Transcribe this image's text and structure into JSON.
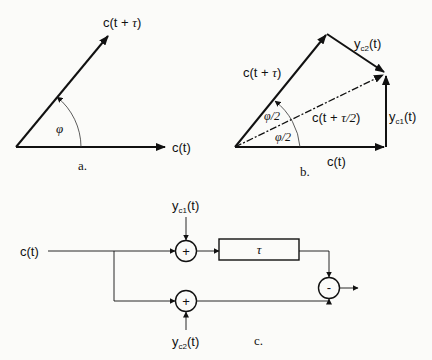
{
  "diagram_a": {
    "caption": "a.",
    "vector_ref_label": "c(t)",
    "vector_delayed_label_prefix": "c(t  + ",
    "vector_delayed_label_tau": "τ",
    "vector_delayed_label_suffix": ")",
    "angle_label": "φ"
  },
  "diagram_b": {
    "caption": "b.",
    "vector_ref_label": "c(t)",
    "vector_delayed_label_prefix": "c(t  + ",
    "vector_delayed_label_tau": "τ",
    "vector_delayed_label_suffix": ")",
    "vector_half_label_prefix": "c(t  + ",
    "vector_half_label_tau": "τ/2",
    "vector_half_label_suffix": ")",
    "yc1_label_main": "y",
    "yc1_label_sub": "c1",
    "yc1_label_arg": "(t)",
    "yc2_label_main": "y",
    "yc2_label_sub": "c2",
    "yc2_label_arg": "(t)",
    "half_angle_upper": "φ/2",
    "half_angle_lower": "φ/2"
  },
  "diagram_c": {
    "caption": "c.",
    "input_label": "c(t)",
    "sum1_symbol": "+",
    "sum2_symbol": "+",
    "diff_symbol": "-",
    "delay_block_label": "τ",
    "yc1_label_main": "y",
    "yc1_label_sub": "c1",
    "yc1_label_arg": "(t)",
    "yc2_label_main": "y",
    "yc2_label_sub": "c2",
    "yc2_label_arg": "(t)"
  }
}
